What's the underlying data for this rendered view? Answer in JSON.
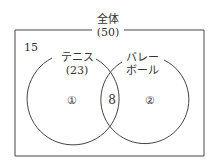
{
  "diagram": {
    "type": "venn",
    "universe": {
      "label": "全体",
      "count": "(50)"
    },
    "outside_count": "15",
    "sets": [
      {
        "label": "テニス",
        "count": "(23)",
        "region_label": "①"
      },
      {
        "label_line1": "バレー",
        "label_line2": "ボール",
        "region_label": "②"
      }
    ],
    "intersection_count": "8",
    "colors": {
      "line": "#444444",
      "text": "#333333",
      "background": "#ffffff"
    }
  }
}
